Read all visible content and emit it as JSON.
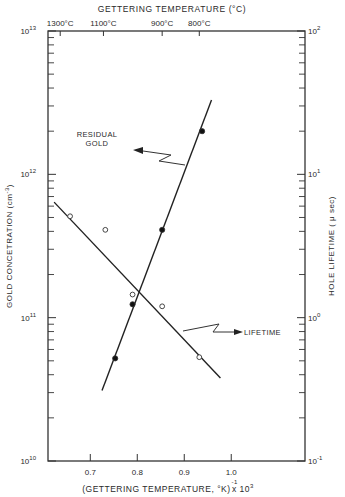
{
  "chart_data": {
    "type": "scatter",
    "title": "",
    "top_axis": {
      "label": "GETTERING TEMPERATURE (°C)",
      "ticks": [
        {
          "label": "1300°C",
          "x": 0.636
        },
        {
          "label": "1100°C",
          "x": 0.728
        },
        {
          "label": "900°C",
          "x": 0.853
        },
        {
          "label": "800°C",
          "x": 0.932
        }
      ]
    },
    "xlabel": "(GETTERING TEMPERATURE, °K)",
    "xlabel_suffix": "x 10",
    "xlabel_exp_neg": "-1",
    "xlabel_exp": "3",
    "xlim": [
      0.61,
      1.157
    ],
    "xticks": [
      0.7,
      0.8,
      0.9,
      1.0
    ],
    "xtick_labels": [
      "0.7",
      "0.8",
      "0.9",
      "1.0"
    ],
    "ylabel_left": "GOLD CONCETRATION (cm",
    "ylabel_left_exp": "-3",
    "ylabel_left_close": ")",
    "ylim_left_log10": [
      10,
      13
    ],
    "yticks_left": [
      {
        "base": "10",
        "exp": "13",
        "log": 13
      },
      {
        "base": "10",
        "exp": "12",
        "log": 12
      },
      {
        "base": "10",
        "exp": "11",
        "log": 11
      },
      {
        "base": "10",
        "exp": "10",
        "log": 10
      }
    ],
    "ylabel_right": "HOLE LIFETIME ( μ sec)",
    "ylim_right_log10": [
      -1,
      2
    ],
    "yticks_right": [
      {
        "base": "10",
        "exp": "2",
        "log": 2
      },
      {
        "base": "10",
        "exp": "1",
        "log": 1
      },
      {
        "base": "10",
        "exp": "0",
        "log": 0
      },
      {
        "base": "10",
        "exp": "-1",
        "log": -1
      }
    ],
    "yscale": "log",
    "grid": false,
    "series": [
      {
        "name": "Residual Gold",
        "axis": "left",
        "marker": "filled-circle",
        "x": [
          0.753,
          0.79,
          0.853,
          0.938
        ],
        "y": [
          52000000000.0,
          124000000000.0,
          410000000000.0,
          2000000000000.0
        ],
        "fit_line": {
          "x": [
            0.725,
            0.958
          ],
          "y": [
            31000000000.0,
            3300000000000.0
          ]
        }
      },
      {
        "name": "Lifetime",
        "axis": "right",
        "marker": "open-circle",
        "x": [
          0.657,
          0.732,
          0.79,
          0.853,
          0.932
        ],
        "y": [
          5.1,
          4.1,
          1.45,
          1.2,
          0.53
        ],
        "fit_line": {
          "x": [
            0.623,
            0.977
          ],
          "y": [
            6.4,
            0.38
          ]
        }
      }
    ],
    "annotations": [
      {
        "text_line1": "RESIDUAL",
        "text_line2": "GOLD",
        "points_to": "Residual Gold"
      },
      {
        "text": "LIFETIME",
        "points_to": "Lifetime"
      }
    ]
  }
}
